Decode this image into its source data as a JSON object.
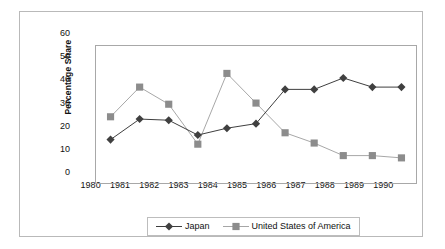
{
  "chart_data": {
    "type": "line",
    "title": "",
    "xlabel": "",
    "ylabel": "Percentage Share",
    "categories": [
      "1980",
      "1981",
      "1982",
      "1983",
      "1984",
      "1985",
      "1986",
      "1987",
      "1988",
      "1989",
      "1990"
    ],
    "ylim": [
      0,
      60
    ],
    "yticks": [
      0,
      10,
      20,
      30,
      40,
      50,
      60
    ],
    "grid": false,
    "legend_position": "bottom",
    "series": [
      {
        "name": "Japan",
        "marker": "diamond",
        "color": "#404040",
        "line_color": "#3d3d3d",
        "values": [
          19,
          28,
          27.5,
          21,
          24,
          26,
          41,
          41,
          46,
          42,
          42
        ]
      },
      {
        "name": "United States of America",
        "marker": "square",
        "color": "#8c8c8c",
        "line_color": "#a6a6a6",
        "values": [
          29,
          42,
          34.5,
          17,
          48,
          35,
          22,
          17.5,
          12,
          12,
          11
        ]
      }
    ]
  },
  "axis": {
    "ytick_labels": [
      "60",
      "50",
      "40",
      "30",
      "20",
      "10",
      "0"
    ],
    "xtick_labels": [
      "1980",
      "1981",
      "1982",
      "1983",
      "1984",
      "1985",
      "1986",
      "1987",
      "1988",
      "1989",
      "1990"
    ],
    "ylabel_text": "Percentage Share"
  },
  "legend": {
    "entries": [
      {
        "label": "Japan"
      },
      {
        "label": "United States of America"
      }
    ]
  }
}
